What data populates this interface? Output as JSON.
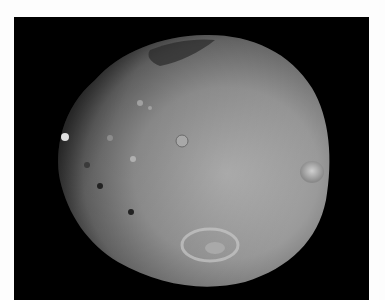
{
  "image": {
    "subject": "moon-phobos",
    "background_color": "#000000",
    "margin_color": "#fdfdfd",
    "surface_colors": {
      "light": "#b9b9b9",
      "mid": "#8f8f8f",
      "dark": "#3a3a3a"
    }
  }
}
